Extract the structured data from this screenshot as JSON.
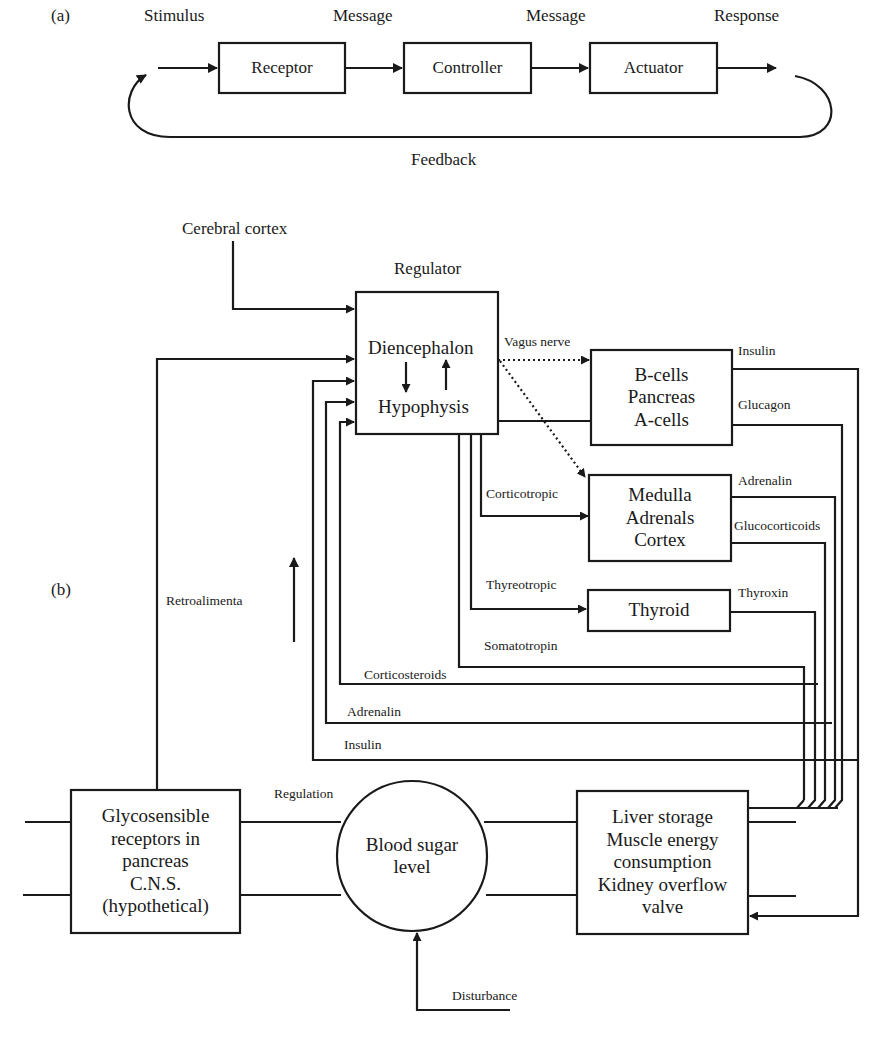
{
  "panel_a": {
    "label": "(a)",
    "signals": {
      "stimulus": "Stimulus",
      "message1": "Message",
      "message2": "Message",
      "response": "Response"
    },
    "blocks": {
      "receptor": "Receptor",
      "controller": "Controller",
      "actuator": "Actuator"
    },
    "feedback": "Feedback"
  },
  "panel_b": {
    "label": "(b)",
    "cerebral_cortex": "Cerebral cortex",
    "regulator_title": "Regulator",
    "regulator": {
      "line1": "Diencephalon",
      "line2": "Hypophysis"
    },
    "vagus_nerve": "Vagus nerve",
    "pancreas": {
      "line1": "B-cells",
      "line2": "Pancreas",
      "line3": "A-cells"
    },
    "adrenals": {
      "line1": "Medulla",
      "line2": "Adrenals",
      "line3": "Cortex"
    },
    "thyroid": "Thyroid",
    "hormone_outputs": {
      "insulin": "Insulin",
      "glucagon": "Glucagon",
      "adrenalin": "Adrenalin",
      "glucocorticoids": "Glucocorticoids",
      "thyroxin": "Thyroxin"
    },
    "tropic_labels": {
      "corticotropic": "Corticotropic",
      "thyreotropic": "Thyreotropic",
      "somatotropin": "Somatotropin"
    },
    "feedback_labels": {
      "corticosteroids": "Corticosteroids",
      "adrenalin": "Adrenalin",
      "insulin": "Insulin"
    },
    "retroalimenta": "Retroalimenta",
    "regulation": "Regulation",
    "glycosensible": {
      "line1": "Glycosensible",
      "line2": "receptors in",
      "line3": "pancreas",
      "line4": "C.N.S.",
      "line5": "(hypothetical)"
    },
    "blood_sugar": {
      "line1": "Blood sugar",
      "line2": "level"
    },
    "effectors": {
      "line1": "Liver storage",
      "line2": "Muscle energy",
      "line3": "consumption",
      "line4": "Kidney overflow",
      "line5": "valve"
    },
    "disturbance": "Disturbance"
  },
  "colors": {
    "line": "#1a1a1a",
    "background": "#ffffff"
  }
}
